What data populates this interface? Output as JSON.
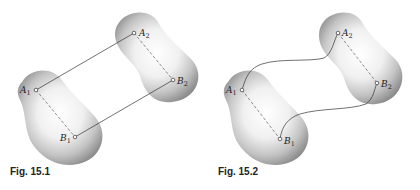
{
  "figures": [
    {
      "caption": "Fig. 15.1",
      "points": {
        "A1": {
          "label": "A",
          "sub": "1"
        },
        "B1": {
          "label": "B",
          "sub": "1"
        },
        "A2": {
          "label": "A",
          "sub": "2"
        },
        "B2": {
          "label": "B",
          "sub": "2"
        }
      },
      "connection": "straight parallel lines"
    },
    {
      "caption": "Fig. 15.2",
      "points": {
        "A1": {
          "label": "A",
          "sub": "1"
        },
        "B1": {
          "label": "B",
          "sub": "1"
        },
        "A2": {
          "label": "A",
          "sub": "2"
        },
        "B2": {
          "label": "B",
          "sub": "2"
        }
      },
      "connection": "curved paths"
    }
  ]
}
